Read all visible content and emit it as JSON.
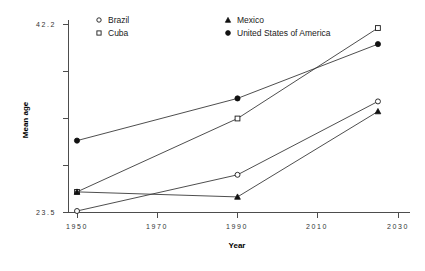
{
  "chart_data": {
    "type": "line",
    "title": "",
    "xlabel": "Year",
    "ylabel": "Mean age",
    "x": [
      1950,
      1990,
      2025
    ],
    "xlim": [
      1950,
      2030
    ],
    "ylim": [
      23.5,
      42.2
    ],
    "xticks": [
      1950,
      1970,
      1990,
      2010,
      2030
    ],
    "xtick_labels": [
      "1950",
      "1970",
      "1990",
      "2010",
      "2030"
    ],
    "yticks": [
      23.5,
      28.175,
      32.85,
      37.525,
      42.2
    ],
    "ytick_labels": [
      "23.5",
      "",
      "",
      "",
      "42.2"
    ],
    "ytick_label_top": "42.2",
    "ytick_label_bottom": "23.5",
    "grid": false,
    "legend_position": "top",
    "series": [
      {
        "name": "Brazil",
        "marker": "open-circle",
        "values": [
          23.6,
          27.2,
          34.5
        ]
      },
      {
        "name": "Cuba",
        "marker": "open-square",
        "values": [
          25.5,
          32.8,
          41.8
        ]
      },
      {
        "name": "Mexico",
        "marker": "filled-triangle",
        "values": [
          25.5,
          25.0,
          33.5
        ]
      },
      {
        "name": "United States of America",
        "marker": "filled-circle",
        "values": [
          30.6,
          34.8,
          40.2
        ]
      }
    ],
    "colors": {
      "line": "#3a3a3a",
      "axis": "#4d4d4d",
      "marker_fill_open": "#ffffff",
      "marker_fill_solid": "#111111",
      "background": "#ffffff"
    }
  },
  "legend": {
    "entries": [
      {
        "label": "Brazil",
        "marker": "open-circle"
      },
      {
        "label": "Cuba",
        "marker": "open-square"
      },
      {
        "label": "Mexico",
        "marker": "filled-triangle"
      },
      {
        "label": "United States of America",
        "marker": "filled-circle"
      }
    ]
  }
}
